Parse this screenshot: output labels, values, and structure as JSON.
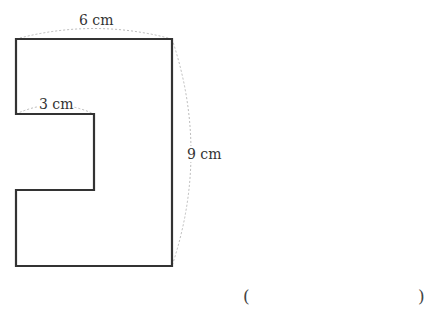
{
  "figure": {
    "shape": "rectilinear polygon with rectangular notch on left side",
    "labels": {
      "top_width": "6 cm",
      "notch_width": "3 cm",
      "height": "9 cm"
    },
    "colors": {
      "outline": "#333333",
      "dimension_line": "#bbbbbb"
    }
  },
  "answer": {
    "open_paren": "(",
    "close_paren": ")"
  }
}
